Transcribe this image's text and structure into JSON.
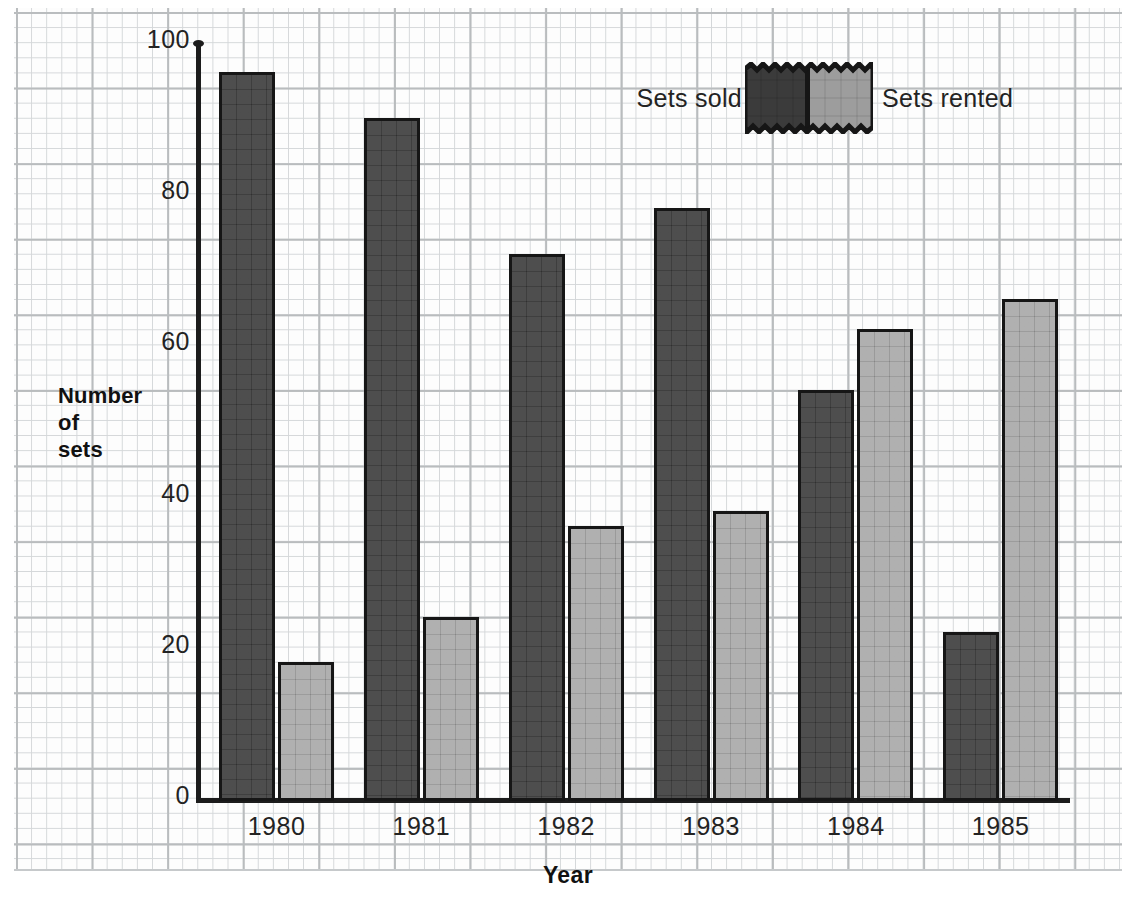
{
  "chart_data": {
    "type": "bar",
    "title": "",
    "xlabel": "Year",
    "ylabel": "Number of sets",
    "ylabel_lines": [
      "Number",
      "of",
      "sets"
    ],
    "categories": [
      "1980",
      "1981",
      "1982",
      "1983",
      "1984",
      "1985"
    ],
    "series": [
      {
        "name": "Sets sold",
        "values": [
          96,
          90,
          72,
          78,
          54,
          22
        ],
        "color": "#3b3b3b"
      },
      {
        "name": "Sets rented",
        "values": [
          18,
          24,
          36,
          38,
          62,
          66
        ],
        "color": "#9d9d9d"
      }
    ],
    "ylim": [
      0,
      100
    ],
    "yticks": [
      0,
      20,
      40,
      60,
      80,
      100
    ],
    "ytick_labels": [
      "0",
      "20",
      "40",
      "60",
      "80",
      "100"
    ],
    "grid": true,
    "grid_style": "graph-paper",
    "legend_position": "top-right"
  },
  "legend": {
    "sold_label": "Sets sold",
    "rented_label": "Sets rented"
  },
  "colors": {
    "sold": "#3b3b3b",
    "rented": "#9d9d9d",
    "axis": "#1c1c1c",
    "grid_major": "#b9bcbe",
    "grid_minor": "#d4d7d9",
    "background": "#ffffff"
  }
}
